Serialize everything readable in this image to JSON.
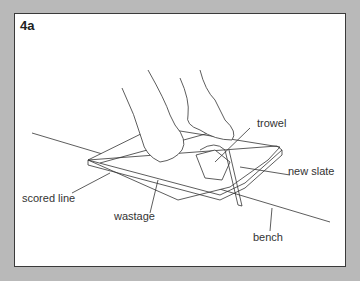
{
  "figure": {
    "number": "4a",
    "labels": {
      "trowel": "trowel",
      "new_slate": "new slate",
      "scored_line": "scored line",
      "wastage": "wastage",
      "bench": "bench"
    }
  },
  "colors": {
    "background": "#b9b9b9",
    "panel": "#ffffff",
    "ink": "#333333"
  }
}
